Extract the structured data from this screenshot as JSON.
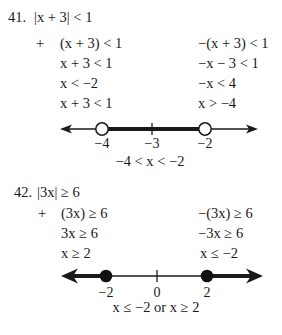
{
  "problems": [
    {
      "number": "41.",
      "statement": "|x + 3| < 1",
      "plus_sign": "+",
      "left_steps": [
        "(x + 3) < 1",
        "x + 3 < 1",
        "x < −2",
        "x + 3 < 1"
      ],
      "right_steps": [
        "−(x + 3) < 1",
        "−x − 3 < 1",
        "−x < 4",
        "x > −4"
      ],
      "number_line": {
        "type": "open-interval",
        "tick_labels": [
          "−4",
          "−3",
          "−2"
        ],
        "endpoints": [
          "open",
          "open"
        ]
      },
      "solution": "−4 < x < −2"
    },
    {
      "number": "42.",
      "statement": "|3x| ≥ 6",
      "plus_sign": "+",
      "left_steps": [
        "(3x) ≥ 6",
        "3x ≥ 6",
        "x ≥ 2"
      ],
      "right_steps": [
        "−(3x) ≥ 6",
        "−3x ≥ 6",
        "x ≤ −2"
      ],
      "number_line": {
        "type": "two-rays",
        "tick_labels": [
          "−2",
          "0",
          "2"
        ],
        "endpoints": [
          "closed",
          "closed"
        ]
      },
      "solution": "x ≤ −2 or x ≥ 2"
    }
  ]
}
